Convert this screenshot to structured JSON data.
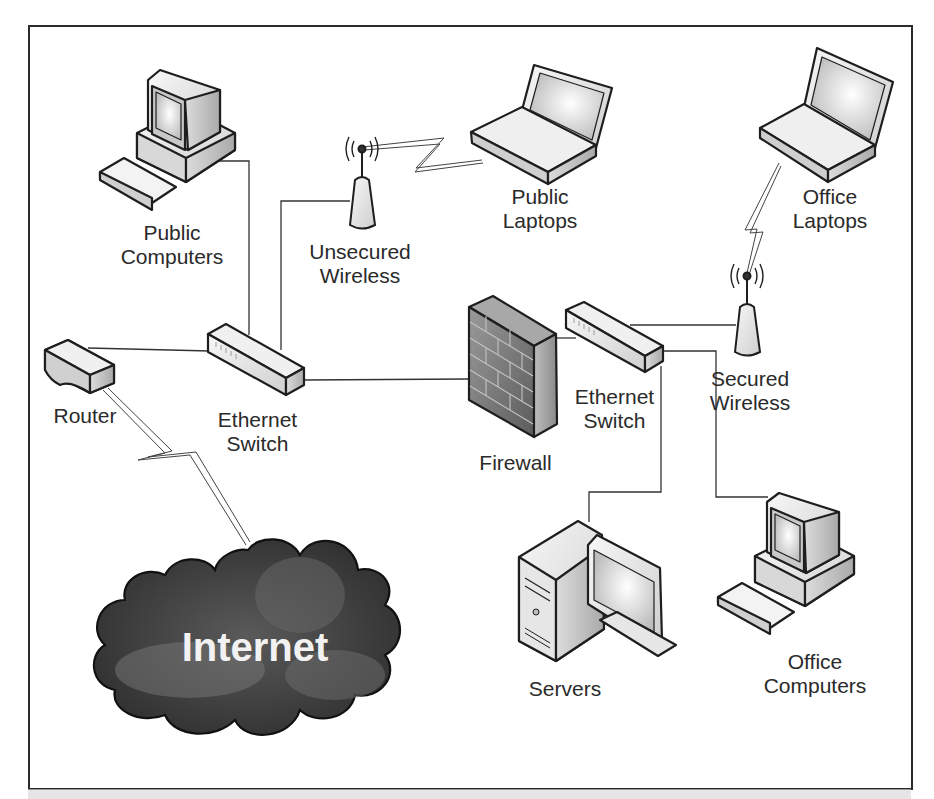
{
  "diagram": {
    "colors": {
      "line": "#333333",
      "device_fill_light": "#eeeeee",
      "device_fill_mid": "#cfcfcf",
      "firewall_fill": "#7a7a7a",
      "cloud_fill": "#444444",
      "cloud_text": "#f2f2f2",
      "frame": "#2a2a2a"
    },
    "nodes": [
      {
        "id": "public-computers",
        "icon": "desktop-computer-icon",
        "label": [
          "Public",
          "Computers"
        ]
      },
      {
        "id": "unsecured-wireless",
        "icon": "wireless-access-point-icon",
        "label": [
          "Unsecured",
          "Wireless"
        ]
      },
      {
        "id": "public-laptops",
        "icon": "laptop-icon",
        "label": [
          "Public",
          "Laptops"
        ]
      },
      {
        "id": "office-laptops",
        "icon": "laptop-icon",
        "label": [
          "Office",
          "Laptops"
        ]
      },
      {
        "id": "router",
        "icon": "router-icon",
        "label": [
          "Router"
        ]
      },
      {
        "id": "ethernet-switch-1",
        "icon": "ethernet-switch-icon",
        "label": [
          "Ethernet",
          "Switch"
        ]
      },
      {
        "id": "firewall",
        "icon": "firewall-icon",
        "label": [
          "Firewall"
        ]
      },
      {
        "id": "ethernet-switch-2",
        "icon": "ethernet-switch-icon",
        "label": [
          "Ethernet",
          "Switch"
        ]
      },
      {
        "id": "secured-wireless",
        "icon": "wireless-access-point-icon",
        "label": [
          "Secured",
          "Wireless"
        ]
      },
      {
        "id": "servers",
        "icon": "server-icon",
        "label": [
          "Servers"
        ]
      },
      {
        "id": "office-computers",
        "icon": "desktop-computer-icon",
        "label": [
          "Office",
          "Computers"
        ]
      },
      {
        "id": "internet",
        "icon": "cloud-icon",
        "label": [
          "Internet"
        ]
      }
    ],
    "edges": [
      {
        "from": "router",
        "to": "ethernet-switch-1",
        "type": "wired"
      },
      {
        "from": "router",
        "to": "internet",
        "type": "wireless-link"
      },
      {
        "from": "public-computers",
        "to": "ethernet-switch-1",
        "type": "wired"
      },
      {
        "from": "unsecured-wireless",
        "to": "ethernet-switch-1",
        "type": "wired"
      },
      {
        "from": "unsecured-wireless",
        "to": "public-laptops",
        "type": "wireless-link"
      },
      {
        "from": "ethernet-switch-1",
        "to": "firewall",
        "type": "wired"
      },
      {
        "from": "firewall",
        "to": "ethernet-switch-2",
        "type": "wired"
      },
      {
        "from": "ethernet-switch-2",
        "to": "secured-wireless",
        "type": "wired"
      },
      {
        "from": "secured-wireless",
        "to": "office-laptops",
        "type": "wireless-link"
      },
      {
        "from": "ethernet-switch-2",
        "to": "servers",
        "type": "wired"
      },
      {
        "from": "ethernet-switch-2",
        "to": "office-computers",
        "type": "wired"
      }
    ]
  }
}
